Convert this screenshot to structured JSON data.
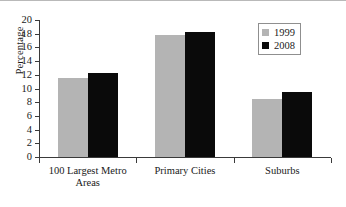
{
  "chart_data": {
    "type": "bar",
    "title": "",
    "xlabel": "",
    "ylabel": "Percentage",
    "ylim": [
      0,
      20
    ],
    "ytick_step": 2,
    "yticks": [
      20,
      18,
      16,
      14,
      12,
      10,
      8,
      6,
      4,
      2,
      0
    ],
    "grid": false,
    "legend_position": "top-right",
    "categories": [
      "100 Largest Metro Areas",
      "Primary Cities",
      "Suburbs"
    ],
    "category_lines": [
      [
        "100 Largest Metro",
        "Areas"
      ],
      [
        "Primary Cities"
      ],
      [
        "Suburbs"
      ]
    ],
    "series": [
      {
        "name": "1999",
        "color": "#b4b4b4",
        "values": [
          11.6,
          17.8,
          8.4
        ]
      },
      {
        "name": "2008",
        "color": "#0a0a0a",
        "values": [
          12.2,
          18.2,
          9.5
        ]
      }
    ]
  },
  "legend": {
    "items": [
      {
        "label": "1999",
        "color": "#b4b4b4"
      },
      {
        "label": "2008",
        "color": "#0a0a0a"
      }
    ]
  },
  "axis": {
    "y_title": "Percentage"
  }
}
